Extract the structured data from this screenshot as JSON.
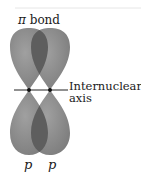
{
  "title": {
    "symbol": "π",
    "text": " bond"
  },
  "axis_label": {
    "line1": "Internuclear",
    "line2": "axis"
  },
  "orbital_labels": [
    "p",
    "p"
  ],
  "colors": {
    "lobe": "#8c8c8c",
    "lobe_edge": "#7a7a7a",
    "overlap": "#5e5e5e",
    "axis": "#222222",
    "nucleus": "#111111",
    "top_rule": "#e6e6e6"
  }
}
